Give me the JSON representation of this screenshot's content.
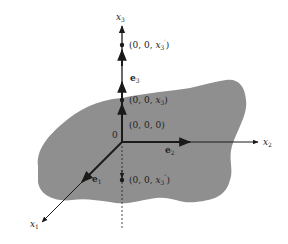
{
  "diagram": {
    "colors": {
      "plane": "#8f8f8f",
      "axis": "#1a1a1a",
      "text": "#222222",
      "background": "#ffffff"
    },
    "axes": {
      "x1": {
        "label": "x",
        "sub": "1"
      },
      "x2": {
        "label": "x",
        "sub": "2"
      },
      "x3": {
        "label": "x",
        "sub": "3"
      }
    },
    "origin_label": "0",
    "basis_vectors": {
      "e1": {
        "label": "e",
        "sub": "1"
      },
      "e2": {
        "label": "e",
        "sub": "2"
      },
      "e3": {
        "label": "e",
        "sub": "3"
      }
    },
    "points": [
      {
        "id": "x3-prime",
        "text": "(0, 0, ",
        "var": "x",
        "sub": "3",
        "sup": "′",
        "close": ")"
      },
      {
        "id": "x3",
        "text": "(0, 0, ",
        "var": "x",
        "sub": "3",
        "sup": "",
        "close": ")"
      },
      {
        "id": "origin",
        "text": "(0, 0, 0)"
      },
      {
        "id": "x3-double-prime",
        "text": "(0, 0, ",
        "var": "x",
        "sub": "3",
        "sup": "″",
        "close": ")"
      }
    ]
  }
}
